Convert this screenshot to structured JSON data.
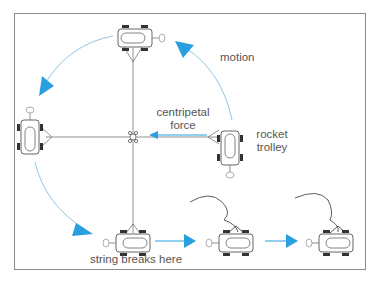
{
  "figure": {
    "colors": {
      "frame": "#8c8c8c",
      "arrow": "#2a9fe0",
      "arc": "#8fc6e6",
      "string": "#777777",
      "trolley": "#555555",
      "text": "#555555"
    },
    "labels": {
      "motion": "motion",
      "centripetal_line1": "centripetal",
      "centripetal_line2": "force",
      "rocket_line1": "rocket",
      "rocket_line2": "trolley",
      "string_breaks": "string breaks here"
    },
    "trolleys": [
      {
        "name": "top",
        "x": 135,
        "y": 38,
        "rotation": 0
      },
      {
        "name": "left",
        "x": 30,
        "y": 133,
        "rotation": 90
      },
      {
        "name": "right",
        "x": 230,
        "y": 148,
        "rotation": -90
      },
      {
        "name": "bottom",
        "x": 133,
        "y": 243,
        "rotation": 180
      },
      {
        "name": "after-break-1",
        "x": 236,
        "y": 242,
        "rotation": 180
      },
      {
        "name": "after-break-2",
        "x": 336,
        "y": 242,
        "rotation": 180
      }
    ]
  }
}
